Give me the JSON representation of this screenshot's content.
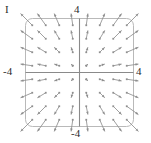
{
  "figure": {
    "panel_label": "I",
    "axis_labels": {
      "top": "4",
      "left": "-4",
      "right": "4",
      "bottom": "-4"
    },
    "colors": {
      "frame": "#b9b9b9",
      "axis": "#8a8a8a",
      "arrow": "#8f8f8f",
      "background": "#ffffff",
      "text": "#2b2b2b"
    }
  },
  "chart_data": {
    "type": "scatter",
    "subtype": "vector-field",
    "title": "I",
    "xlabel": "",
    "ylabel": "",
    "xlim": [
      -4,
      4
    ],
    "ylim": [
      -4,
      4
    ],
    "xticklabels": [
      "-4",
      "4"
    ],
    "yticklabels": [
      "-4",
      "4"
    ],
    "grid": false,
    "legend": null,
    "axes_cross_at": [
      0,
      0
    ],
    "field_formula": {
      "u": "x",
      "v": "y"
    },
    "grid_points_x": [
      -3.5,
      -2.5,
      -1.5,
      -0.5,
      0.5,
      1.5,
      2.5,
      3.5
    ],
    "grid_points_y": [
      -3.5,
      -2.5,
      -1.5,
      -0.5,
      0.5,
      1.5,
      2.5,
      3.5
    ],
    "vectors": [
      {
        "x": -3.5,
        "y": 3.5,
        "u": -3.5,
        "v": 3.5
      },
      {
        "x": -2.5,
        "y": 3.5,
        "u": -2.5,
        "v": 3.5
      },
      {
        "x": -1.5,
        "y": 3.5,
        "u": -1.5,
        "v": 3.5
      },
      {
        "x": -0.5,
        "y": 3.5,
        "u": -0.5,
        "v": 3.5
      },
      {
        "x": 0.5,
        "y": 3.5,
        "u": 0.5,
        "v": 3.5
      },
      {
        "x": 1.5,
        "y": 3.5,
        "u": 1.5,
        "v": 3.5
      },
      {
        "x": 2.5,
        "y": 3.5,
        "u": 2.5,
        "v": 3.5
      },
      {
        "x": 3.5,
        "y": 3.5,
        "u": 3.5,
        "v": 3.5
      },
      {
        "x": -3.5,
        "y": 2.5,
        "u": -3.5,
        "v": 2.5
      },
      {
        "x": -2.5,
        "y": 2.5,
        "u": -2.5,
        "v": 2.5
      },
      {
        "x": -1.5,
        "y": 2.5,
        "u": -1.5,
        "v": 2.5
      },
      {
        "x": -0.5,
        "y": 2.5,
        "u": -0.5,
        "v": 2.5
      },
      {
        "x": 0.5,
        "y": 2.5,
        "u": 0.5,
        "v": 2.5
      },
      {
        "x": 1.5,
        "y": 2.5,
        "u": 1.5,
        "v": 2.5
      },
      {
        "x": 2.5,
        "y": 2.5,
        "u": 2.5,
        "v": 2.5
      },
      {
        "x": 3.5,
        "y": 2.5,
        "u": 3.5,
        "v": 2.5
      },
      {
        "x": -3.5,
        "y": 1.5,
        "u": -3.5,
        "v": 1.5
      },
      {
        "x": -2.5,
        "y": 1.5,
        "u": -2.5,
        "v": 1.5
      },
      {
        "x": -1.5,
        "y": 1.5,
        "u": -1.5,
        "v": 1.5
      },
      {
        "x": -0.5,
        "y": 1.5,
        "u": -0.5,
        "v": 1.5
      },
      {
        "x": 0.5,
        "y": 1.5,
        "u": 0.5,
        "v": 1.5
      },
      {
        "x": 1.5,
        "y": 1.5,
        "u": 1.5,
        "v": 1.5
      },
      {
        "x": 2.5,
        "y": 1.5,
        "u": 2.5,
        "v": 1.5
      },
      {
        "x": 3.5,
        "y": 1.5,
        "u": 3.5,
        "v": 1.5
      },
      {
        "x": -3.5,
        "y": 0.5,
        "u": -3.5,
        "v": 0.5
      },
      {
        "x": -2.5,
        "y": 0.5,
        "u": -2.5,
        "v": 0.5
      },
      {
        "x": -1.5,
        "y": 0.5,
        "u": -1.5,
        "v": 0.5
      },
      {
        "x": -0.5,
        "y": 0.5,
        "u": -0.5,
        "v": 0.5
      },
      {
        "x": 0.5,
        "y": 0.5,
        "u": 0.5,
        "v": 0.5
      },
      {
        "x": 1.5,
        "y": 0.5,
        "u": 1.5,
        "v": 0.5
      },
      {
        "x": 2.5,
        "y": 0.5,
        "u": 2.5,
        "v": 0.5
      },
      {
        "x": 3.5,
        "y": 0.5,
        "u": 3.5,
        "v": 0.5
      },
      {
        "x": -3.5,
        "y": -0.5,
        "u": -3.5,
        "v": -0.5
      },
      {
        "x": -2.5,
        "y": -0.5,
        "u": -2.5,
        "v": -0.5
      },
      {
        "x": -1.5,
        "y": -0.5,
        "u": -1.5,
        "v": -0.5
      },
      {
        "x": -0.5,
        "y": -0.5,
        "u": -0.5,
        "v": -0.5
      },
      {
        "x": 0.5,
        "y": -0.5,
        "u": 0.5,
        "v": -0.5
      },
      {
        "x": 1.5,
        "y": -0.5,
        "u": 1.5,
        "v": -0.5
      },
      {
        "x": 2.5,
        "y": -0.5,
        "u": 2.5,
        "v": -0.5
      },
      {
        "x": 3.5,
        "y": -0.5,
        "u": 3.5,
        "v": -0.5
      },
      {
        "x": -3.5,
        "y": -1.5,
        "u": -3.5,
        "v": -1.5
      },
      {
        "x": -2.5,
        "y": -1.5,
        "u": -2.5,
        "v": -1.5
      },
      {
        "x": -1.5,
        "y": -1.5,
        "u": -1.5,
        "v": -1.5
      },
      {
        "x": -0.5,
        "y": -1.5,
        "u": -0.5,
        "v": -1.5
      },
      {
        "x": 0.5,
        "y": -1.5,
        "u": 0.5,
        "v": -1.5
      },
      {
        "x": 1.5,
        "y": -1.5,
        "u": 1.5,
        "v": -1.5
      },
      {
        "x": 2.5,
        "y": -1.5,
        "u": 2.5,
        "v": -1.5
      },
      {
        "x": 3.5,
        "y": -1.5,
        "u": 3.5,
        "v": -1.5
      },
      {
        "x": -3.5,
        "y": -2.5,
        "u": -3.5,
        "v": -2.5
      },
      {
        "x": -2.5,
        "y": -2.5,
        "u": -2.5,
        "v": -2.5
      },
      {
        "x": -1.5,
        "y": -2.5,
        "u": -1.5,
        "v": -2.5
      },
      {
        "x": -0.5,
        "y": -2.5,
        "u": -0.5,
        "v": -2.5
      },
      {
        "x": 0.5,
        "y": -2.5,
        "u": 0.5,
        "v": -2.5
      },
      {
        "x": 1.5,
        "y": -2.5,
        "u": 1.5,
        "v": -2.5
      },
      {
        "x": 2.5,
        "y": -2.5,
        "u": 2.5,
        "v": -2.5
      },
      {
        "x": 3.5,
        "y": -2.5,
        "u": 3.5,
        "v": -2.5
      },
      {
        "x": -3.5,
        "y": -3.5,
        "u": -3.5,
        "v": -3.5
      },
      {
        "x": -2.5,
        "y": -3.5,
        "u": -2.5,
        "v": -3.5
      },
      {
        "x": -1.5,
        "y": -3.5,
        "u": -1.5,
        "v": -3.5
      },
      {
        "x": -0.5,
        "y": -3.5,
        "u": -0.5,
        "v": -3.5
      },
      {
        "x": 0.5,
        "y": -3.5,
        "u": 0.5,
        "v": -3.5
      },
      {
        "x": 1.5,
        "y": -3.5,
        "u": 1.5,
        "v": -3.5
      },
      {
        "x": 2.5,
        "y": -3.5,
        "u": 2.5,
        "v": -3.5
      },
      {
        "x": 3.5,
        "y": -3.5,
        "u": 3.5,
        "v": -3.5
      }
    ]
  }
}
